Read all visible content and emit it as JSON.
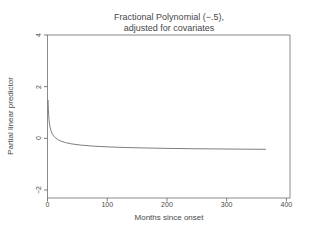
{
  "figure": {
    "background": "#ffffff"
  },
  "chart_data": {
    "type": "line",
    "title_line1": "Fractional Polynomial (−.5),",
    "title_line2": "adjusted for covariates",
    "xlabel": "Months since onset",
    "ylabel": "Partial linear predictor",
    "series_name": "fractional-polynomial-fit",
    "x": [
      1,
      1.2,
      1.5,
      2,
      2.5,
      3,
      4,
      5,
      6,
      8,
      10,
      13,
      17,
      22,
      30,
      40,
      55,
      75,
      100,
      130,
      165,
      200,
      240,
      280,
      320,
      365
    ],
    "y": [
      1.47,
      1.296,
      1.103,
      0.884,
      0.735,
      0.625,
      0.47,
      0.364,
      0.286,
      0.177,
      0.102,
      0.025,
      -0.045,
      -0.104,
      -0.165,
      -0.214,
      -0.26,
      -0.299,
      -0.33,
      -0.355,
      -0.374,
      -0.389,
      -0.401,
      -0.41,
      -0.418,
      -0.425
    ],
    "xlim": [
      0,
      406
    ],
    "ylim": [
      -2.31,
      4
    ],
    "xticks": [
      0,
      100,
      200,
      300,
      400
    ],
    "xtick_labels": [
      "0",
      "100",
      "200",
      "300",
      "400"
    ],
    "yticks": [
      4,
      2,
      0,
      -2
    ],
    "ytick_labels": [
      "4",
      "2",
      "0",
      "−2"
    ],
    "grid": false,
    "legend": "none",
    "frame": true,
    "curve_color": "#6e6e6e",
    "frame_color": "#8a8a8a",
    "tick_color": "#7a7a7a",
    "text_color": "#474747"
  }
}
